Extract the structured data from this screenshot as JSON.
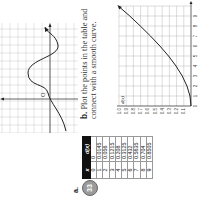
{
  "problem": {
    "number": "33",
    "part_a_label": "a.",
    "part_b_label": "b.",
    "part_b_text": "Plot the points in the table and connect with a smooth curve."
  },
  "table": {
    "headers": [
      "x",
      "d(x)"
    ],
    "rows": [
      [
        "0",
        "0"
      ],
      [
        "1",
        "0.0145"
      ],
      [
        "2",
        "0.056"
      ],
      [
        "3",
        "0.1215"
      ],
      [
        "4",
        "0.208"
      ],
      [
        "5",
        "0.3125"
      ],
      [
        "6",
        "0.432"
      ],
      [
        "7",
        "0.5635"
      ],
      [
        "8",
        "0.704"
      ],
      [
        "9",
        "0.8505"
      ]
    ]
  },
  "prev_graph": {
    "axis_x_label": "x",
    "origin_label": "O"
  },
  "chart_data": {
    "type": "line",
    "title": "",
    "xlabel": "x",
    "ylabel": "d(x)",
    "x": [
      0,
      1,
      2,
      3,
      4,
      5,
      6,
      7,
      8,
      9
    ],
    "values": [
      0,
      0.0145,
      0.056,
      0.1215,
      0.208,
      0.3125,
      0.432,
      0.5635,
      0.704,
      0.8505
    ],
    "x_ticks": [
      "0",
      "1",
      "2",
      "3",
      "4",
      "5",
      "6",
      "7",
      "8",
      "9"
    ],
    "y_ticks": [
      "0.1",
      "0.2",
      "0.3",
      "0.4",
      "0.5",
      "0.6",
      "0.7",
      "0.8",
      "0.9",
      "1.0"
    ],
    "xlim": [
      0,
      10
    ],
    "ylim": [
      0,
      1.0
    ],
    "grid": true
  }
}
